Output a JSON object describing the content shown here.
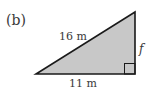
{
  "figure": {
    "label": "(b)",
    "hypotenuse_label": "16 m",
    "base_label": "11 m",
    "side_label": "f"
  },
  "colors": {
    "fill": "#c8c8c8",
    "stroke": "#1a1a1a",
    "text": "#3a3a3a"
  }
}
